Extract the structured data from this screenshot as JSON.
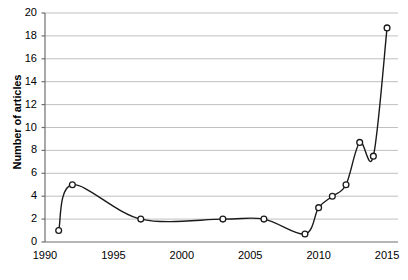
{
  "chart_data": {
    "type": "line",
    "title": "",
    "xlabel": "",
    "ylabel": "Number of articles",
    "xlim": [
      1990,
      2015.8
    ],
    "ylim": [
      0,
      20
    ],
    "grid": true,
    "legend": false,
    "marker": "open-circle",
    "line_color": "#1a1a1a",
    "grid_color": "#b9b9b9",
    "x": [
      1991,
      1992,
      1997,
      2003,
      2006,
      2009,
      2010,
      2011,
      2012,
      2013,
      2014,
      2015
    ],
    "values": [
      1,
      5,
      2,
      2,
      2,
      0.7,
      3,
      4,
      5,
      8.7,
      7.5,
      18.7
    ],
    "x_ticks": [
      1990,
      1995,
      2000,
      2005,
      2010,
      2015
    ],
    "x_tick_labels": [
      "1990",
      "1995",
      "2000",
      "2005",
      "2010",
      "2015"
    ],
    "y_ticks": [
      0,
      2,
      4,
      6,
      8,
      10,
      12,
      14,
      16,
      18,
      20
    ],
    "y_tick_labels": [
      "0",
      "2",
      "4",
      "6",
      "8",
      "10",
      "12",
      "14",
      "16",
      "18",
      "20"
    ]
  }
}
